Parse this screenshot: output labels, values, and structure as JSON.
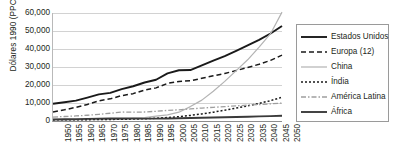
{
  "chart_data": {
    "type": "line",
    "title": "",
    "xlabel": "",
    "ylabel": "Dólares 1990 (PPC)",
    "xlim": [
      1950,
      2050
    ],
    "ylim": [
      0,
      60000
    ],
    "grid": true,
    "legend_position": "right",
    "x": [
      1950,
      1955,
      1960,
      1965,
      1970,
      1975,
      1980,
      1985,
      1990,
      1995,
      2000,
      2005,
      2010,
      2015,
      2020,
      2025,
      2030,
      2035,
      2040,
      2045,
      2050
    ],
    "y_ticks": [
      0,
      10000,
      20000,
      30000,
      40000,
      50000,
      60000
    ],
    "y_tick_labels": [
      "0",
      "10,000",
      "20,000",
      "30,000",
      "40,000",
      "50,000",
      "60,000"
    ],
    "x_tick_labels": [
      "1950",
      "1955",
      "1960",
      "1965",
      "1970",
      "1975",
      "1980",
      "1985",
      "1990",
      "1995",
      "2000",
      "2005",
      "2010",
      "2015",
      "2020",
      "2025",
      "2030",
      "2035",
      "2040",
      "2045",
      "2050"
    ],
    "series": [
      {
        "name": "Estados Unidos",
        "style": "thick-solid",
        "color": "#1a1a1a",
        "width": 1.9,
        "dash": "",
        "values": [
          9560,
          10400,
          11300,
          13000,
          14800,
          15600,
          17700,
          19300,
          21400,
          22900,
          26500,
          28200,
          28300,
          30900,
          33500,
          36100,
          39000,
          42000,
          45100,
          48600,
          52800
        ]
      },
      {
        "name": "Europa (12)",
        "style": "dashed",
        "color": "#1a1a1a",
        "width": 1.5,
        "dash": "5,3",
        "values": [
          5000,
          6200,
          7600,
          9200,
          11200,
          12300,
          14100,
          15200,
          17200,
          18400,
          20900,
          22000,
          22400,
          23700,
          25100,
          26400,
          28000,
          29700,
          31500,
          33700,
          36600
        ]
      },
      {
        "name": "China",
        "style": "thin-solid",
        "color": "#b3b3b3",
        "width": 1.2,
        "dash": "",
        "values": [
          450,
          580,
          600,
          700,
          800,
          900,
          1060,
          1500,
          1870,
          2700,
          3400,
          4900,
          8000,
          11600,
          16500,
          22000,
          28000,
          34000,
          41000,
          48500,
          60500
        ]
      },
      {
        "name": "Índia",
        "style": "dotted",
        "color": "#1a1a1a",
        "width": 1.5,
        "dash": "2,2",
        "values": [
          620,
          650,
          700,
          750,
          820,
          880,
          940,
          1080,
          1240,
          1500,
          1900,
          2400,
          3100,
          3900,
          4900,
          6000,
          7200,
          8400,
          9800,
          11300,
          13200
        ]
      },
      {
        "name": "América Latina",
        "style": "dash-dot",
        "color": "#9e9e9e",
        "width": 1.3,
        "dash": "5,2,1.5,2",
        "values": [
          2200,
          2500,
          2800,
          3200,
          3700,
          4300,
          5000,
          4900,
          5000,
          5400,
          5900,
          6200,
          6700,
          7200,
          7600,
          8000,
          8400,
          8800,
          9100,
          9500,
          10000
        ]
      },
      {
        "name": "África",
        "style": "thick-solid",
        "color": "#3a3a3a",
        "width": 1.9,
        "dash": "",
        "values": [
          900,
          980,
          1060,
          1180,
          1300,
          1380,
          1420,
          1380,
          1340,
          1310,
          1380,
          1500,
          1650,
          1800,
          1950,
          2100,
          2250,
          2400,
          2550,
          2700,
          2900
        ]
      }
    ]
  },
  "legend": {
    "items": [
      {
        "label": "Estados Unidos"
      },
      {
        "label": "Europa (12)"
      },
      {
        "label": "China"
      },
      {
        "label": "Índia"
      },
      {
        "label": "América Latina"
      },
      {
        "label": "África"
      }
    ]
  }
}
